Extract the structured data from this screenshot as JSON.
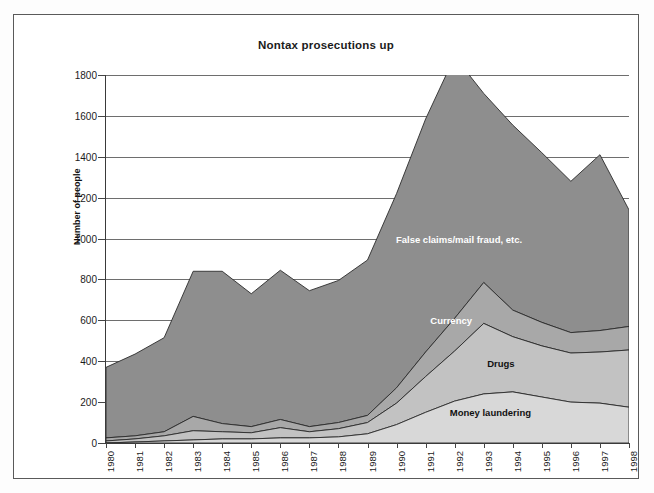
{
  "chart_data": {
    "type": "area",
    "stacked": true,
    "title": "Nontax prosecutions up",
    "xlabel": "",
    "ylabel": "Number of people",
    "ylim": [
      0,
      1800
    ],
    "ytick_step": 200,
    "yticks": [
      0,
      200,
      400,
      600,
      800,
      1000,
      1200,
      1400,
      1600,
      1800
    ],
    "grid": true,
    "legend": "inline-labels",
    "categories": [
      "1980",
      "1981",
      "1982",
      "1983",
      "1984",
      "1985",
      "1986",
      "1987",
      "1988",
      "1989",
      "1990",
      "1991",
      "1992",
      "1993",
      "1994",
      "1995",
      "1996",
      "1997",
      "1998"
    ],
    "series": [
      {
        "name": "Money laundering",
        "color": "#d8d8d8",
        "label_color": "#111111",
        "values": [
          0,
          5,
          10,
          15,
          20,
          20,
          25,
          25,
          30,
          45,
          90,
          150,
          205,
          240,
          250,
          225,
          200,
          195,
          175
        ]
      },
      {
        "name": "Drugs",
        "color": "#c2c2c2",
        "label_color": "#111111",
        "values": [
          10,
          15,
          25,
          45,
          35,
          30,
          50,
          30,
          40,
          55,
          105,
          175,
          245,
          345,
          270,
          250,
          240,
          250,
          280
        ]
      },
      {
        "name": "Currency",
        "color": "#a8a8a8",
        "label_color": "#ffffff",
        "values": [
          15,
          15,
          20,
          70,
          40,
          30,
          40,
          25,
          30,
          35,
          75,
          120,
          160,
          200,
          130,
          115,
          100,
          105,
          115
        ]
      },
      {
        "name": "False claims/mail fraud, etc.",
        "color": "#8e8e8e",
        "label_color": "#ffffff",
        "values": [
          345,
          400,
          460,
          710,
          745,
          650,
          730,
          665,
          695,
          760,
          950,
          1140,
          1280,
          925,
          905,
          830,
          740,
          860,
          570
        ]
      }
    ],
    "totals": [
      370,
      435,
      515,
      840,
      840,
      730,
      845,
      745,
      795,
      895,
      1220,
      1585,
      1890,
      1710,
      1555,
      1420,
      1280,
      1410,
      1140
    ],
    "series_label_positions": [
      {
        "name": "False claims/mail fraud, etc.",
        "x_pct": 67.5,
        "y_value": 1000
      },
      {
        "name": "Currency",
        "x_pct": 66.0,
        "y_value": 600
      },
      {
        "name": "Drugs",
        "x_pct": 75.5,
        "y_value": 390
      },
      {
        "name": "Money laundering",
        "x_pct": 73.5,
        "y_value": 150
      }
    ]
  }
}
